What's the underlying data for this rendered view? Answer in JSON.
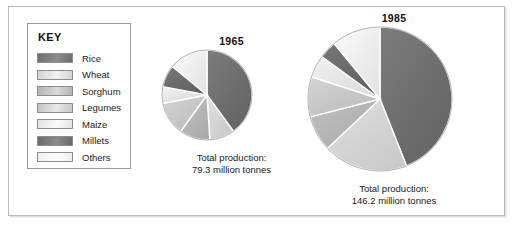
{
  "figure": {
    "legend": {
      "title": "KEY",
      "items": [
        {
          "label": "Rice",
          "color": "#6e6e6e",
          "color_light": "#8d8d8d"
        },
        {
          "label": "Wheat",
          "color": "#d3d3d3",
          "color_light": "#f1f1f1"
        },
        {
          "label": "Sorghum",
          "color": "#b4b4b4",
          "color_light": "#d8d8d8"
        },
        {
          "label": "Legumes",
          "color": "#c6c6c6",
          "color_light": "#e8e8e8"
        },
        {
          "label": "Maize",
          "color": "#e4e4e4",
          "color_light": "#fafafa"
        },
        {
          "label": "Millets",
          "color": "#6a6a6a",
          "color_light": "#8a8a8a"
        },
        {
          "label": "Others",
          "color": "#ededed",
          "color_light": "#ffffff"
        }
      ]
    },
    "charts": [
      {
        "id": "1965",
        "year": "1965",
        "caption_line1": "Total production:",
        "caption_line2": "79.3 million tonnes",
        "radius": 45,
        "total_label": "79.3 million tonnes"
      },
      {
        "id": "1985",
        "year": "1985",
        "caption_line1": "Total production:",
        "caption_line2": "146.2 million tonnes",
        "radius": 72,
        "total_label": "146.2 million tonnes"
      }
    ]
  },
  "chart_data": [
    {
      "type": "pie",
      "title": "1965",
      "subtitle": "Total production: 79.3 million tonnes",
      "total": 79.3,
      "units": "million tonnes",
      "legend_position": "left",
      "categories": [
        "Rice",
        "Wheat",
        "Sorghum",
        "Legumes",
        "Maize",
        "Millets",
        "Others"
      ],
      "values": [
        40,
        9,
        11,
        12,
        6,
        8,
        14
      ],
      "value_units": "percent",
      "colors": [
        "#6e6e6e",
        "#d3d3d3",
        "#b4b4b4",
        "#c6c6c6",
        "#e4e4e4",
        "#6a6a6a",
        "#ededed"
      ]
    },
    {
      "type": "pie",
      "title": "1985",
      "subtitle": "Total production: 146.2 million tonnes",
      "total": 146.2,
      "units": "million tonnes",
      "legend_position": "left",
      "categories": [
        "Rice",
        "Wheat",
        "Sorghum",
        "Legumes",
        "Maize",
        "Millets",
        "Others"
      ],
      "values": [
        44,
        19,
        8,
        9,
        5,
        4,
        11
      ],
      "value_units": "percent",
      "colors": [
        "#6e6e6e",
        "#d3d3d3",
        "#b4b4b4",
        "#c6c6c6",
        "#e4e4e4",
        "#6a6a6a",
        "#ededed"
      ]
    }
  ]
}
